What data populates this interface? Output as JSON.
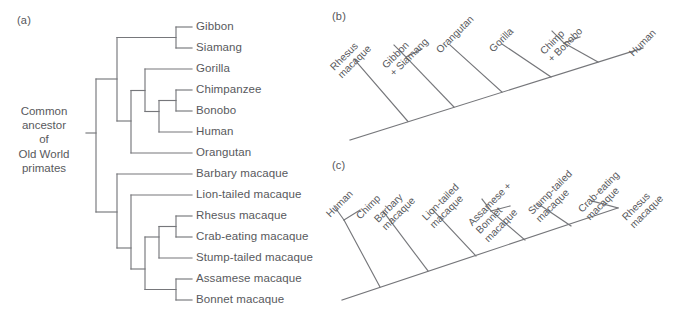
{
  "figure": {
    "line_color": "#76777b",
    "text_color": "#58595d",
    "background": "#ffffff"
  },
  "panel_a": {
    "letter": "(a)",
    "root_label_lines": [
      "Common",
      "ancestor",
      "of",
      "Old World",
      "primates"
    ],
    "tips": [
      {
        "label": "Gibbon",
        "y": 27
      },
      {
        "label": "Siamang",
        "y": 48
      },
      {
        "label": "Gorilla",
        "y": 69
      },
      {
        "label": "Chimpanzee",
        "y": 90
      },
      {
        "label": "Bonobo",
        "y": 111
      },
      {
        "label": "Human",
        "y": 132
      },
      {
        "label": "Orangutan",
        "y": 153
      },
      {
        "label": "Barbary macaque",
        "y": 174
      },
      {
        "label": "Lion-tailed macaque",
        "y": 195
      },
      {
        "label": "Rhesus macaque",
        "y": 216
      },
      {
        "label": "Crab-eating macaque",
        "y": 237
      },
      {
        "label": "Stump-tailed macaque",
        "y": 258
      },
      {
        "label": "Assamese macaque",
        "y": 279
      },
      {
        "label": "Bonnet macaque",
        "y": 300
      }
    ]
  },
  "panel_b": {
    "letter": "(b)",
    "taxa": [
      {
        "lines": [
          "Rhesus",
          "macaque"
        ]
      },
      {
        "lines": [
          "Gibbon",
          "+ Siamang"
        ]
      },
      {
        "lines": [
          "Orangutan"
        ]
      },
      {
        "lines": [
          "Gorilla"
        ]
      },
      {
        "lines": [
          "Chimp",
          "+ Bonobo"
        ]
      },
      {
        "lines": [
          "Human"
        ]
      }
    ]
  },
  "panel_c": {
    "letter": "(c)",
    "taxa": [
      {
        "lines": [
          "Human"
        ]
      },
      {
        "lines": [
          "Chimp"
        ]
      },
      {
        "lines": [
          "Barbary",
          "macaque"
        ]
      },
      {
        "lines": [
          "Lion-tailed",
          "macaque"
        ]
      },
      {
        "lines": [
          "Assamese +",
          "Bonnet",
          "macaque"
        ]
      },
      {
        "lines": [
          "Stump-tailed",
          "macaque"
        ]
      },
      {
        "lines": [
          "Crab-eating",
          "macaque"
        ]
      },
      {
        "lines": [
          "Rhesus",
          "macaque"
        ]
      }
    ]
  }
}
